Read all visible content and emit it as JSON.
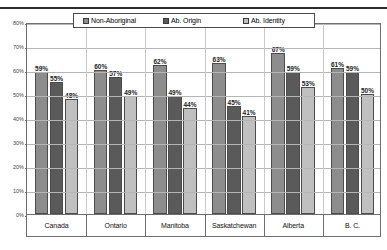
{
  "chart_data": {
    "type": "bar",
    "title": "",
    "xlabel": "",
    "ylabel": "",
    "ylim": [
      0,
      80
    ],
    "ytick_step": 10,
    "ytick_labels": [
      "0%",
      "10%",
      "20%",
      "30%",
      "40%",
      "50%",
      "60%",
      "70%",
      "80%"
    ],
    "grid": true,
    "legend_position": "top-center",
    "value_suffix": "%",
    "categories": [
      "Canada",
      "Ontario",
      "Manitoba",
      "Saskatchewan",
      "Alberta",
      "B. C."
    ],
    "series": [
      {
        "name": "Non-Aboriginal",
        "color": "#8d8d8d",
        "values": [
          59,
          60,
          62,
          63,
          67,
          61
        ],
        "labels": [
          "59%",
          "60%",
          "62%",
          "63%",
          "67%",
          "61%"
        ]
      },
      {
        "name": "Ab. Origin",
        "color": "#5a5a5a",
        "values": [
          55,
          57,
          49,
          45,
          59,
          59
        ],
        "labels": [
          "55%",
          "57%",
          "49%",
          "45%",
          "59%",
          "59%"
        ]
      },
      {
        "name": "Ab. Identity",
        "color": "#c0c0c0",
        "values": [
          48,
          49,
          44,
          41,
          53,
          50
        ],
        "labels": [
          "48%",
          "49%",
          "44%",
          "41%",
          "53%",
          "50%"
        ]
      }
    ]
  },
  "legend": {
    "items": [
      {
        "label": "Non-Aboriginal"
      },
      {
        "label": "Ab. Origin"
      },
      {
        "label": "Ab. Identity"
      }
    ]
  }
}
